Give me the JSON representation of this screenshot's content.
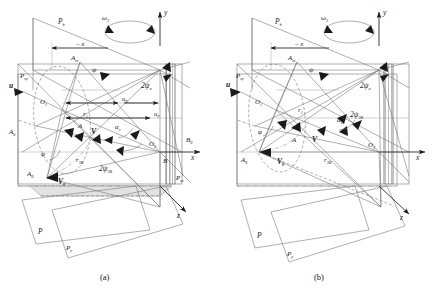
{
  "figure": {
    "type": "engineering-geometry-diagram",
    "panels": [
      {
        "id": "a",
        "caption": "(a)",
        "labels": {
          "plane_h": "P",
          "plane_h_sub": "h",
          "plane_xy": "P",
          "plane_xy_sub": "xy",
          "plane_xz": "P",
          "plane_xz_sub": "xz",
          "plane_p": "P",
          "plane_y": "P",
          "plane_y_sub": "y",
          "omega": "ω",
          "omega_sub": "3",
          "axis_y": "y",
          "axis_x": "x",
          "axis_z": "z",
          "neg_x": "– x",
          "point_O1": "O",
          "point_O1_sub": "1",
          "point_O3": "O",
          "point_O3_sub": "3",
          "point_Am": "A",
          "point_Am_sub": "m",
          "point_Ah": "A",
          "point_Ah_sub": "h",
          "point_A0": "A",
          "point_A0_sub": "0",
          "point_A": "A",
          "point_B0": "B",
          "point_B0_sub": "0",
          "point_B": "B",
          "vec_u": "u",
          "vec_V": "V",
          "vec_V0": "V",
          "vec_V0_sub": "0",
          "angle_psi": "ψ",
          "angle_phi": "φ",
          "angle_alpha_c": "α",
          "angle_alpha_c_sub": "c",
          "angle_2psi_a": "2ψ",
          "angle_2psi_a_sub": "a",
          "angle_2psi_3B": "2ψ",
          "angle_2psi_3B_sub": "3B",
          "radius_r1": "r",
          "radius_r1_sub": "1",
          "radius_r3B": "r",
          "radius_r3B_sub": "3B",
          "dim_uE": "u",
          "dim_uE_sub": "E",
          "dim_uF": "u",
          "dim_uF_sub": "F"
        }
      },
      {
        "id": "b",
        "caption": "(b)",
        "labels": {
          "plane_h": "P",
          "plane_h_sub": "h",
          "plane_xy": "P",
          "plane_xy_sub": "xy",
          "plane_p": "P",
          "plane_y": "P",
          "plane_y_sub": "y",
          "omega": "ω",
          "omega_sub": "3",
          "axis_y": "y",
          "axis_x": "x",
          "axis_z": "z",
          "neg_x": "– x",
          "point_O1": "O",
          "point_O1_sub": "1",
          "point_O3": "O",
          "point_O3_sub": "3",
          "point_Am": "A",
          "point_Am_sub": "m",
          "point_A0": "A",
          "point_A0_sub": "0",
          "point_A": "A",
          "vec_u": "u",
          "vec_V": "V",
          "vec_V0": "V",
          "vec_V0_sub": "0",
          "angle_psi": "ψ",
          "angle_phi": "φ",
          "angle_alpha_c": "α",
          "angle_alpha_c_sub": "c",
          "angle_2psi_a": "2ψ",
          "angle_2psi_a_sub": "a",
          "angle_2psi_3B": "2ψ",
          "angle_2psi_3B_sub": "3B",
          "radius_r1": "r",
          "radius_r1_sub": "1",
          "radius_r3B": "r",
          "radius_r3B_sub": "3B"
        }
      }
    ],
    "colors": {
      "line": "#6e6e6e",
      "axis": "#2a2a2a",
      "text": "#1a1a1a",
      "background": "#ffffff",
      "fill": "#e2e2e2"
    }
  }
}
